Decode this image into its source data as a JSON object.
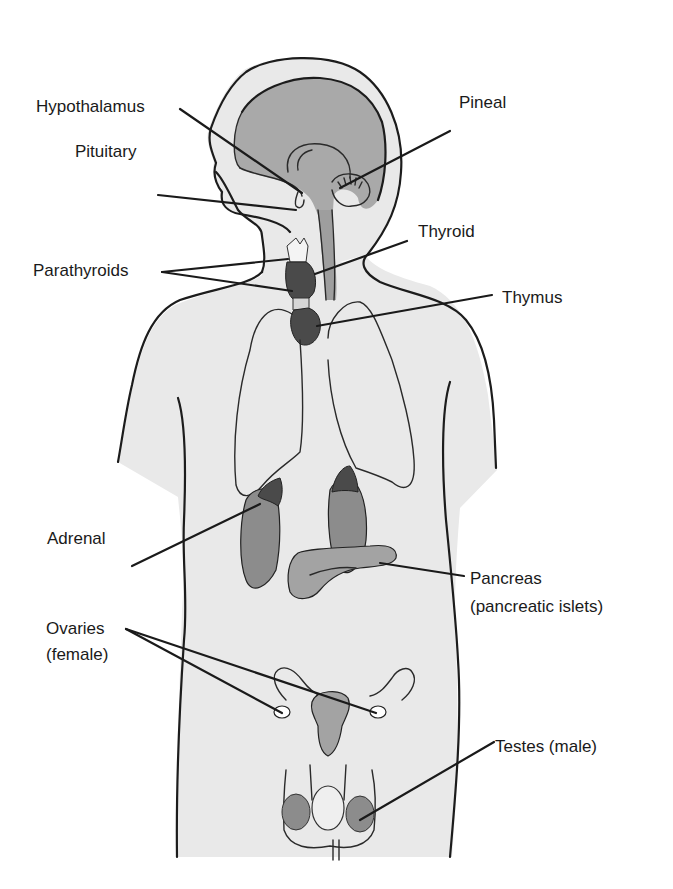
{
  "figure": {
    "colors": {
      "background": "#ffffff",
      "body_fill": "#e9e9e9",
      "brain_fill": "#a9a9a9",
      "gland_dark": "#4a4a4a",
      "organ_mid": "#8c8c8c",
      "pancreas_fill": "#a3a3a3",
      "outline": "#1c1c1c",
      "label_text": "#1a1a1a"
    },
    "labels": {
      "hypothalamus": "Hypothalamus",
      "pituitary": "Pituitary",
      "pineal": "Pineal",
      "thyroid": "Thyroid",
      "parathyroids": "Parathyroids",
      "thymus": "Thymus",
      "adrenal": "Adrenal",
      "pancreas_line1": "Pancreas",
      "pancreas_line2": "(pancreatic islets)",
      "ovaries_line1": "Ovaries",
      "ovaries_line2": "(female)",
      "testes": "Testes (male)"
    }
  }
}
